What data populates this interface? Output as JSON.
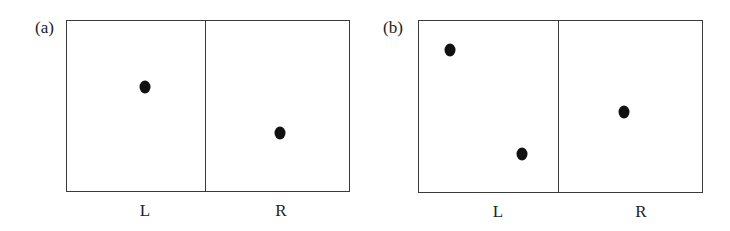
{
  "panels": [
    {
      "id": "a",
      "label": "(a)",
      "regions": [
        {
          "label": "L",
          "dots": [
            {
              "x": 145,
              "y": 87
            }
          ]
        },
        {
          "label": "R",
          "dots": [
            {
              "x": 280,
              "y": 133
            }
          ]
        }
      ]
    },
    {
      "id": "b",
      "label": "(b)",
      "regions": [
        {
          "label": "L",
          "dots": [
            {
              "x": 450,
              "y": 50
            },
            {
              "x": 522,
              "y": 154
            }
          ]
        },
        {
          "label": "R",
          "dots": [
            {
              "x": 624,
              "y": 112
            }
          ]
        }
      ]
    }
  ]
}
